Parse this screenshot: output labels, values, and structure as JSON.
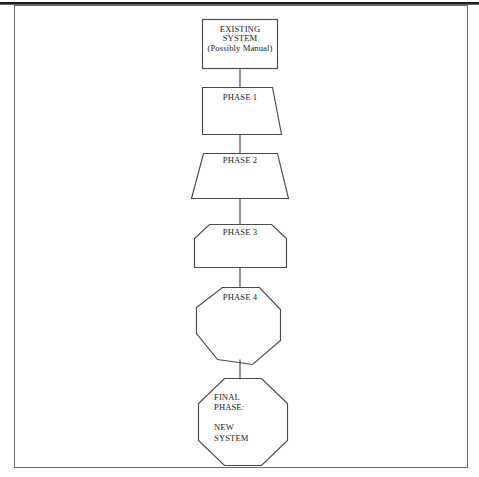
{
  "page": {
    "background_color": "#ffffff",
    "border_color": "#6b6b6b",
    "ink_color": "#1b1b1b"
  },
  "diagram": {
    "type": "flowchart",
    "orientation": "vertical-top-to-bottom",
    "node_count": 6,
    "connector_count": 5,
    "nodes": [
      {
        "id": "existing-system",
        "shape": "rectangle",
        "label": "EXISTING\nSYSTEM\n(Possibly Manual)",
        "line1": "EXISTING",
        "line2": "SYSTEM",
        "line3": "(Possibly Manual)"
      },
      {
        "id": "phase-1",
        "shape": "right-slanted-quadrilateral",
        "label": "PHASE 1"
      },
      {
        "id": "phase-2",
        "shape": "trapezoid-narrow-top",
        "label": "PHASE 2"
      },
      {
        "id": "phase-3",
        "shape": "chamfered-top-pentagon",
        "label": "PHASE 3"
      },
      {
        "id": "phase-4",
        "shape": "heptagon",
        "label": "PHASE 4"
      },
      {
        "id": "final-phase",
        "shape": "octagon",
        "label": "FINAL\nPHASE:\n\nNEW\nSYSTEM",
        "line1": "FINAL",
        "line2": "PHASE:",
        "line3": "NEW",
        "line4": "SYSTEM"
      }
    ],
    "connectors": [
      {
        "from": "existing-system",
        "to": "phase-1",
        "style": "plain-line"
      },
      {
        "from": "phase-1",
        "to": "phase-2",
        "style": "plain-line"
      },
      {
        "from": "phase-2",
        "to": "phase-3",
        "style": "plain-line"
      },
      {
        "from": "phase-3",
        "to": "phase-4",
        "style": "plain-line"
      },
      {
        "from": "phase-4",
        "to": "final-phase",
        "style": "plain-line"
      }
    ]
  }
}
